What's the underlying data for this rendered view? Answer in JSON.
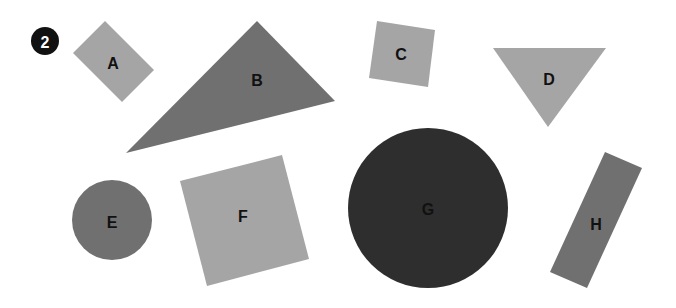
{
  "figure": {
    "number_badge": "2",
    "shapes": [
      {
        "id": "A",
        "label": "A",
        "type": "rectangle",
        "color": "#a5a5a5"
      },
      {
        "id": "B",
        "label": "B",
        "type": "triangle",
        "color": "#707070"
      },
      {
        "id": "C",
        "label": "C",
        "type": "square",
        "color": "#a5a5a5"
      },
      {
        "id": "D",
        "label": "D",
        "type": "triangle",
        "color": "#a5a5a5"
      },
      {
        "id": "E",
        "label": "E",
        "type": "circle",
        "color": "#707070"
      },
      {
        "id": "F",
        "label": "F",
        "type": "square",
        "color": "#a5a5a5"
      },
      {
        "id": "G",
        "label": "G",
        "type": "circle",
        "color": "#2e2e2e"
      },
      {
        "id": "H",
        "label": "H",
        "type": "rectangle",
        "color": "#707070"
      }
    ]
  }
}
